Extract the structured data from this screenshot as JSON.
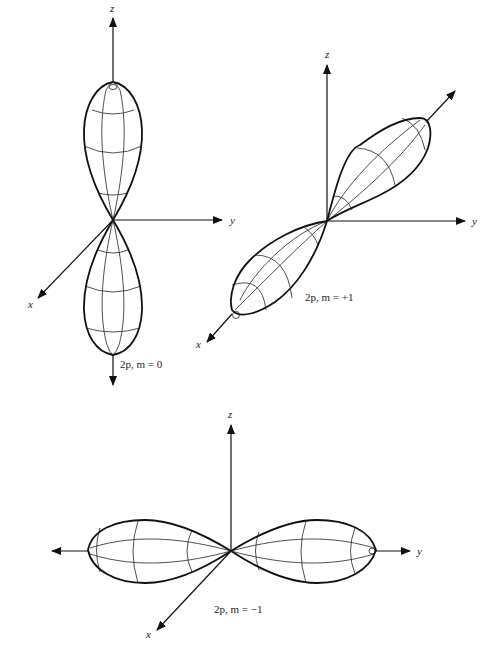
{
  "figures": [
    {
      "id": "m0",
      "caption": "2p, m = 0",
      "axes": {
        "x": "x",
        "y": "y",
        "z": "z"
      },
      "lobe_direction": "z"
    },
    {
      "id": "m+1",
      "caption": "2p, m = +1",
      "axes": {
        "x": "x",
        "y": "y",
        "z": "z"
      },
      "lobe_direction": "diagonal (x–y plane, tilted)"
    },
    {
      "id": "m-1",
      "caption": "2p, m = −1",
      "axes": {
        "x": "x",
        "y": "y",
        "z": "z"
      },
      "lobe_direction": "y"
    }
  ],
  "colors": {
    "ink": "#111111",
    "background": "#ffffff"
  }
}
